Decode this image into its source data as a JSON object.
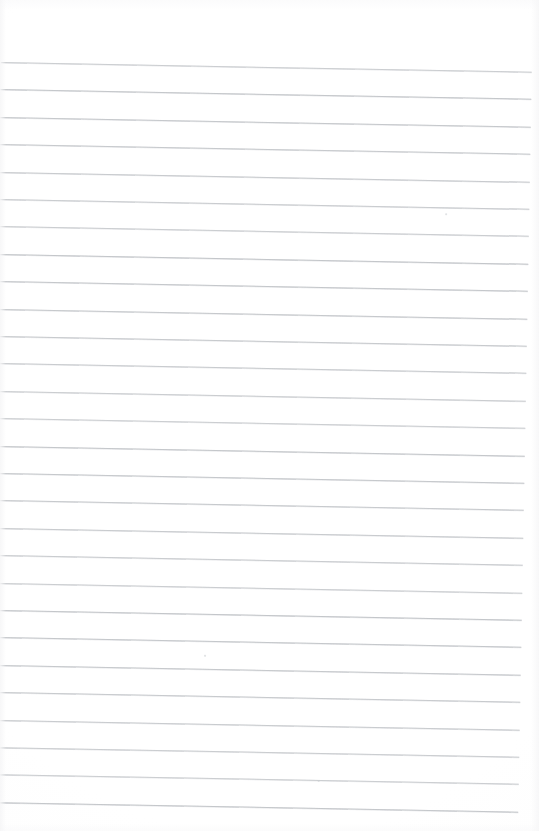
{
  "document": {
    "kind": "scanned-lined-notebook-page",
    "page_width": 539,
    "page_height": 831,
    "paper_color": "#ffffff",
    "rule_color": "#b9bcc0",
    "content_text": "",
    "visible_text": ""
  },
  "ruling": {
    "line_count": 28,
    "spacing": 27.4,
    "first_line_y": 62,
    "left_inset": 2,
    "right_inset": 6,
    "skew_degrees": 1.05,
    "line_thickness": 1,
    "lines_y": [
      62,
      89.4,
      116.8,
      144.2,
      171.6,
      199,
      226.4,
      253.8,
      281.2,
      308.6,
      336,
      363.4,
      390.8,
      418.2,
      445.6,
      473,
      500.4,
      527.8,
      555.2,
      582.6,
      610,
      637.4,
      664.8,
      692.2,
      719.6,
      747,
      774.4,
      801.8
    ]
  },
  "artifacts": {
    "specks": [
      {
        "x": 332,
        "y": 774,
        "size": 2
      },
      {
        "x": 216,
        "y": 651,
        "size": 1.5
      },
      {
        "x": 449,
        "y": 205,
        "size": 1.5
      }
    ]
  }
}
